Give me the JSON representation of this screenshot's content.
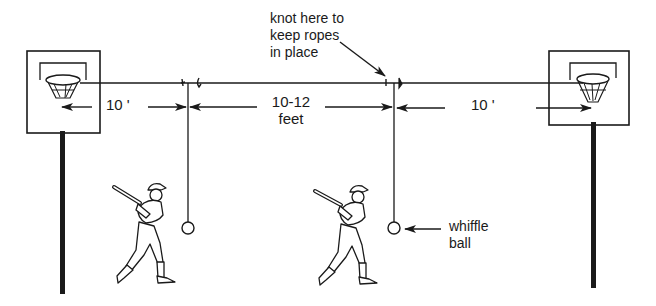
{
  "diagram": {
    "title": "",
    "labels": {
      "knot_note": [
        "knot here to",
        "keep ropes",
        "in place"
      ],
      "left_distance": "10 '",
      "middle_distance": [
        "10-12",
        "feet"
      ],
      "right_distance": "10 '",
      "ball_note": [
        "whiffle",
        "ball"
      ]
    },
    "elements": {
      "left_hoop": "basketball-hoop",
      "right_hoop": "basketball-hoop",
      "main_rope": "horizontal rope strung between hoops",
      "hanging_ropes": 2,
      "balls": 2,
      "batters": 2
    },
    "colors": {
      "ink": "#1a1a1a",
      "background": "#ffffff"
    }
  }
}
